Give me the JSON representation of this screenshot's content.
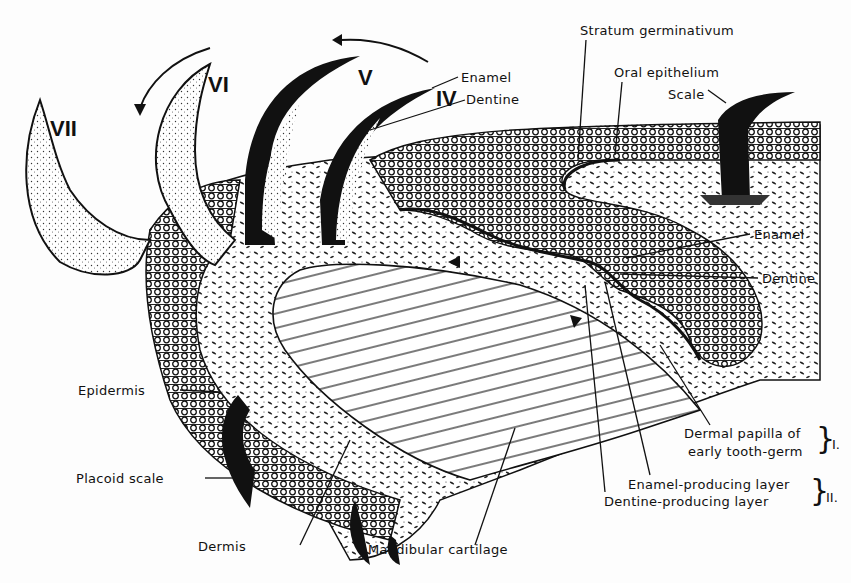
{
  "diagram": {
    "teeth_numerals": [
      "IV",
      "V",
      "VI",
      "VII"
    ],
    "labels": {
      "stratum_germinativum": "Stratum germinativum",
      "oral_epithelium": "Oral epithelium",
      "scale": "Scale",
      "enamel_top": "Enamel",
      "dentine_top": "Dentine",
      "enamel_right": "Enamel",
      "dentine_right": "Dentine",
      "dermal_papilla_1": "Dermal papilla of",
      "dermal_papilla_2": "early tooth-germ",
      "group_1": "I.",
      "enamel_layer": "Enamel-producing layer",
      "dentine_layer": "Dentine-producing layer",
      "group_2": "II.",
      "epidermis": "Epidermis",
      "placoid_scale": "Placoid scale",
      "dermis": "Dermis",
      "mandibular_cartilage": "Mandibular cartilage"
    },
    "colors": {
      "ink": "#111111",
      "paper": "#fdfdfd"
    }
  }
}
